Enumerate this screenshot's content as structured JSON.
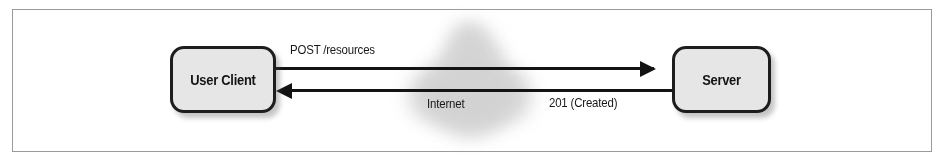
{
  "figure": {
    "frame_color": "#9a9a9a",
    "background": "#ffffff"
  },
  "nodes": [
    {
      "id": "client",
      "label": "User Client",
      "fill": "#e6e6e6",
      "border_color": "#1d1d1d"
    },
    {
      "id": "server",
      "label": "Server",
      "fill": "#e6e6e6",
      "border_color": "#1d1d1d"
    }
  ],
  "cloud": {
    "label": "Internet",
    "color": "#d2d2d2"
  },
  "arrows": [
    {
      "id": "request",
      "label": "POST /resources",
      "from": "client",
      "to": "server",
      "direction": "right",
      "color": "#131313"
    },
    {
      "id": "response",
      "label": "201 (Created)",
      "from": "server",
      "to": "client",
      "direction": "left",
      "color": "#131313"
    }
  ]
}
